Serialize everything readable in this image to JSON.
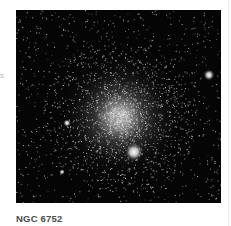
{
  "side_text_fragment": "s",
  "figure": {
    "alt": "Globular star cluster image",
    "caption": "NGC 6752",
    "background_color": "#050505",
    "cluster_core": {
      "x": 104,
      "y": 107,
      "radius": 70
    },
    "bright_stars": [
      {
        "x": 118,
        "y": 142,
        "r": 5
      },
      {
        "x": 193,
        "y": 65,
        "r": 3
      },
      {
        "x": 51,
        "y": 113,
        "r": 2
      },
      {
        "x": 46,
        "y": 162,
        "r": 1.5
      }
    ]
  }
}
